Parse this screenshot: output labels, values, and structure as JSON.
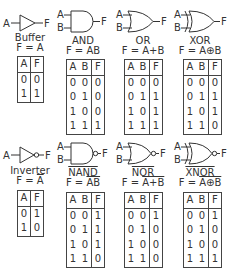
{
  "gates": [
    {
      "name": "Buffer",
      "expr_prefix": "F = ",
      "expr": "A",
      "overline": false,
      "headers": [
        "A",
        "F"
      ],
      "rows": [
        [
          "0",
          "0"
        ],
        [
          "1",
          "1"
        ]
      ]
    },
    {
      "name": "AND",
      "expr_prefix": "F = ",
      "expr": "AB",
      "overline": false,
      "headers": [
        "A",
        "B",
        "F"
      ],
      "rows": [
        [
          "0",
          "0",
          "0"
        ],
        [
          "0",
          "1",
          "0"
        ],
        [
          "1",
          "0",
          "0"
        ],
        [
          "1",
          "1",
          "1"
        ]
      ]
    },
    {
      "name": "OR",
      "expr_prefix": "F = ",
      "expr": "A+B",
      "overline": false,
      "headers": [
        "A",
        "B",
        "F"
      ],
      "rows": [
        [
          "0",
          "0",
          "0"
        ],
        [
          "0",
          "1",
          "1"
        ],
        [
          "1",
          "0",
          "1"
        ],
        [
          "1",
          "1",
          "1"
        ]
      ]
    },
    {
      "name": "XOR",
      "expr_prefix": "F = ",
      "expr": "A⊕B",
      "overline": false,
      "headers": [
        "A",
        "B",
        "F"
      ],
      "rows": [
        [
          "0",
          "0",
          "0"
        ],
        [
          "0",
          "1",
          "1"
        ],
        [
          "1",
          "0",
          "1"
        ],
        [
          "1",
          "1",
          "0"
        ]
      ]
    },
    {
      "name": "Inverter",
      "expr_prefix": "F = ",
      "expr": "A",
      "overline": true,
      "headers": [
        "A",
        "F"
      ],
      "rows": [
        [
          "0",
          "1"
        ],
        [
          "1",
          "0"
        ]
      ]
    },
    {
      "name": "NAND",
      "expr_prefix": "F = ",
      "expr": "AB",
      "overline": true,
      "headers": [
        "A",
        "B",
        "F"
      ],
      "rows": [
        [
          "0",
          "0",
          "1"
        ],
        [
          "0",
          "1",
          "1"
        ],
        [
          "1",
          "0",
          "1"
        ],
        [
          "1",
          "1",
          "0"
        ]
      ]
    },
    {
      "name": "NOR",
      "expr_prefix": "F = ",
      "expr": "A+B",
      "overline": true,
      "headers": [
        "A",
        "B",
        "F"
      ],
      "rows": [
        [
          "0",
          "0",
          "1"
        ],
        [
          "0",
          "1",
          "0"
        ],
        [
          "1",
          "0",
          "0"
        ],
        [
          "1",
          "1",
          "0"
        ]
      ]
    },
    {
      "name": "XNOR",
      "expr_prefix": "F = ",
      "expr": "A⊕B",
      "overline": true,
      "headers": [
        "A",
        "B",
        "F"
      ],
      "rows": [
        [
          "0",
          "0",
          "1"
        ],
        [
          "0",
          "1",
          "0"
        ],
        [
          "1",
          "0",
          "0"
        ],
        [
          "1",
          "1",
          "1"
        ]
      ]
    }
  ],
  "pins": {
    "a": "A",
    "b": "B",
    "f": "F"
  }
}
